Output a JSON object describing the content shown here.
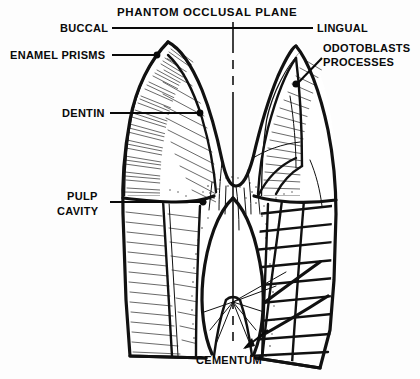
{
  "figure": {
    "background_color": "#fdfdfd",
    "ink_color": "#0a0a0a"
  },
  "labels": {
    "phantom_plane": "PHANTOM OCCLUSAL PLANE",
    "buccal": "BUCCAL",
    "lingual": "LINGUAL",
    "enamel_prisms": "ENAMEL PRISMS",
    "dentin": "DENTIN",
    "pulp_cavity_line1": "PULP",
    "pulp_cavity_line2": "CAVITY",
    "odontoblasts_line1": "ODOTOBLASTS",
    "odontoblasts_line2": "PROCESSES",
    "cementum": "CEMENTUM"
  },
  "structures": [
    {
      "name": "enamel",
      "side": "buccal-and-lingual",
      "texture": "radiating prisms"
    },
    {
      "name": "dentin",
      "side": "both",
      "texture": "fine tubules"
    },
    {
      "name": "pulp-cavity",
      "side": "center",
      "texture": "stippled border"
    },
    {
      "name": "cementum",
      "side": "root",
      "texture": "diagonal hatch bands"
    }
  ]
}
